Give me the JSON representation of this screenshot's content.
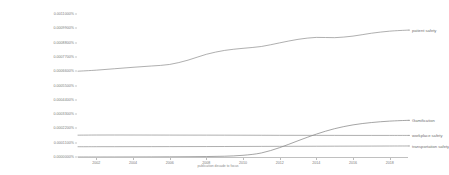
{
  "chart_data": {
    "type": "line",
    "title": "",
    "subtitle": "",
    "xlabel": "publication decade to focus",
    "ylabel": "",
    "grid": false,
    "legend_position": "right-inline",
    "xlim": [
      2001,
      2019
    ],
    "ylim": [
      0.0,
      0.0011
    ],
    "x_ticks": [
      "2002",
      "2004",
      "2006",
      "2008",
      "2010",
      "2012",
      "2014",
      "2016",
      "2018"
    ],
    "x_tick_values": [
      2002,
      2004,
      2006,
      2008,
      2010,
      2012,
      2014,
      2016,
      2018
    ],
    "y_ticks": [
      "0.0011000%",
      "0.0009900%",
      "0.0008800%",
      "0.0007700%",
      "0.0006600%",
      "0.0005500%",
      "0.0004400%",
      "0.0003300%",
      "0.0002200%",
      "0.0001100%",
      "0.0000000%"
    ],
    "y_tick_values": [
      0.0011,
      0.00099,
      0.00088,
      0.00077,
      0.00066,
      0.00055,
      0.00044,
      0.00033,
      0.00022,
      0.00011,
      0.0
    ],
    "x": [
      2001,
      2002,
      2003,
      2004,
      2005,
      2006,
      2007,
      2008,
      2009,
      2010,
      2011,
      2012,
      2013,
      2014,
      2015,
      2016,
      2017,
      2018,
      2019
    ],
    "series": [
      {
        "name": "patient safety",
        "color": "#8c8c8c",
        "label_x": 2019.2,
        "values": [
          0.00066,
          0.000668,
          0.000679,
          0.00069,
          0.0007,
          0.000712,
          0.000745,
          0.00079,
          0.00082,
          0.000836,
          0.00085,
          0.000878,
          0.000905,
          0.00092,
          0.000918,
          0.00093,
          0.000952,
          0.000968,
          0.000976
        ]
      },
      {
        "name": "Gamification",
        "color": "#7e7e7e",
        "label_x": 2019.2,
        "values": [
          0.0,
          0.0,
          2e-07,
          4e-07,
          8e-07,
          1.4e-06,
          2.2e-06,
          3.5e-06,
          6e-06,
          1.3e-05,
          3.1e-05,
          7.2e-05,
          0.000125,
          0.000176,
          0.000218,
          0.000247,
          0.000265,
          0.000276,
          0.000282
        ]
      },
      {
        "name": "workplace safety",
        "color": "#8c8c8c",
        "label_x": 2019.2,
        "values": [
          0.000168,
          0.000169,
          0.0001692,
          0.000169,
          0.0001688,
          0.0001686,
          0.0001684,
          0.0001682,
          0.000168,
          0.0001676,
          0.0001672,
          0.0001668,
          0.0001666,
          0.0001664,
          0.0001662,
          0.000166,
          0.000166,
          0.000166,
          0.000166
        ]
      },
      {
        "name": "transportation safety",
        "color": "#8c8c8c",
        "label_x": 2019.2,
        "values": [
          7.9e-05,
          7.92e-05,
          7.94e-05,
          7.96e-05,
          7.98e-05,
          8e-05,
          8.02e-05,
          8.04e-05,
          8.08e-05,
          8.12e-05,
          8.16e-05,
          8.2e-05,
          8.24e-05,
          8.28e-05,
          8.32e-05,
          8.36e-05,
          8.4e-05,
          8.44e-05,
          8.48e-05
        ]
      }
    ]
  }
}
